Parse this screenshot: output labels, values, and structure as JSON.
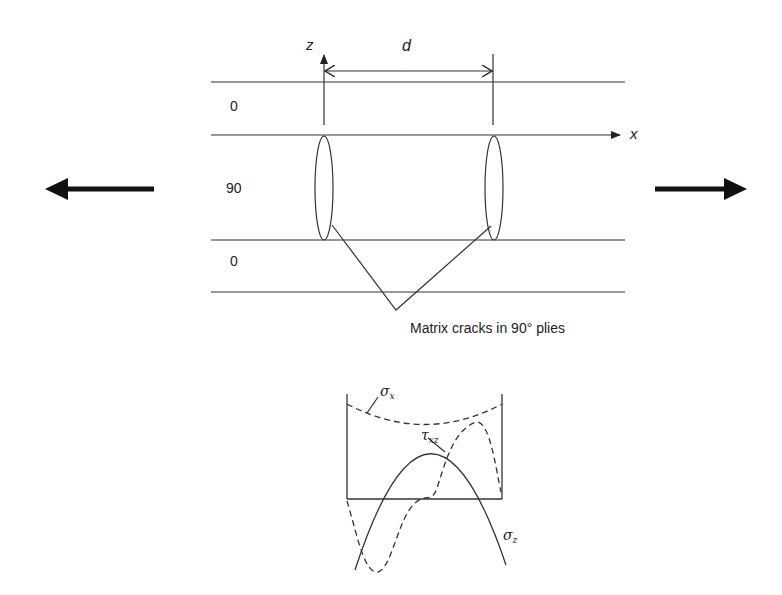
{
  "diagram": {
    "axes": {
      "z_label": "z",
      "x_label": "x"
    },
    "dimension": {
      "label": "d"
    },
    "plies": [
      {
        "label": "0"
      },
      {
        "label": "90"
      },
      {
        "label": "0"
      }
    ],
    "annotation": "Matrix cracks in 90° plies",
    "load_arrows": {
      "left": "tensile-load-left",
      "right": "tensile-load-right"
    },
    "stress_plot": {
      "curves": [
        {
          "name": "sigma_x",
          "symbol": "σ",
          "subscript": "x",
          "style": "dashed"
        },
        {
          "name": "tau_xz",
          "symbol": "τ",
          "subscript": "xz",
          "style": "dashed"
        },
        {
          "name": "sigma_z",
          "symbol": "σ",
          "subscript": "z",
          "style": "solid"
        }
      ]
    },
    "colors": {
      "line": "#222222",
      "background": "#ffffff"
    }
  }
}
